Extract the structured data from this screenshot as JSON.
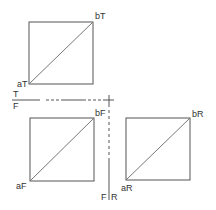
{
  "diagram": {
    "colors": {
      "stroke": "#555555",
      "diagonal": "#777777",
      "text": "#333333",
      "background": "#ffffff"
    },
    "views": [
      {
        "name": "top",
        "box": {
          "x": 29,
          "y": 22,
          "w": 64,
          "h": 62
        },
        "start_label": "aT",
        "end_label": "bT"
      },
      {
        "name": "front",
        "box": {
          "x": 30,
          "y": 118,
          "w": 64,
          "h": 63
        },
        "start_label": "aF",
        "end_label": "bF"
      },
      {
        "name": "right",
        "box": {
          "x": 126,
          "y": 118,
          "w": 64,
          "h": 62
        },
        "start_label": "aR",
        "end_label": "bR"
      }
    ],
    "fold_lines": {
      "horizontal": {
        "upper_label": "T",
        "lower_label": "F"
      },
      "vertical": {
        "left_label": "F",
        "right_label": "R"
      }
    }
  }
}
